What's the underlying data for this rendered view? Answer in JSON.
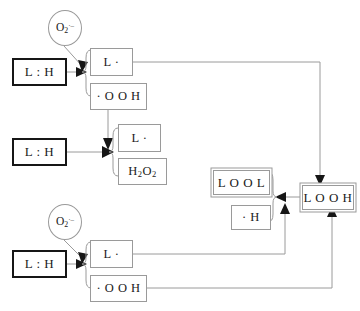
{
  "diagram": {
    "background_color": "#ffffff",
    "line_color": "#9a9a9a",
    "arrow_color": "#161616",
    "thick_border_color": "#161616",
    "nodes": {
      "oxygen_top": {
        "label": "O2",
        "subscript": "2",
        "superscript": "·–",
        "shape": "circle",
        "name": "superoxide-radical-top"
      },
      "oxygen_bottom": {
        "label": "O2",
        "subscript": "2",
        "superscript": "·–",
        "shape": "circle",
        "name": "superoxide-radical-bottom"
      },
      "lh_top": {
        "label": "L : H",
        "shape": "thick-box"
      },
      "lh_middle": {
        "label": "L : H",
        "shape": "thick-box"
      },
      "lh_bottom": {
        "label": "L : H",
        "shape": "thick-box"
      },
      "l_radical_top": {
        "label": "L ·",
        "shape": "thin-box"
      },
      "ooh_top": {
        "label": "· O O H",
        "shape": "thin-box"
      },
      "l_radical_middle": {
        "label": "L ·",
        "shape": "thin-box"
      },
      "h2o2": {
        "label": "H2O2",
        "subscripts": [
          "2",
          "2"
        ],
        "shape": "thin-box"
      },
      "l_radical_bottom": {
        "label": "L ·",
        "shape": "thin-box"
      },
      "ooh_bottom": {
        "label": "· O O H",
        "shape": "thin-box"
      },
      "lool": {
        "label": "L O O L",
        "shape": "double-box"
      },
      "h_radical": {
        "label": "· H",
        "shape": "thin-box"
      },
      "looh": {
        "label": "L O O H",
        "shape": "double-box"
      }
    },
    "braces": [
      {
        "name": "brace-top-products",
        "groups": [
          "l_radical_top",
          "ooh_top"
        ]
      },
      {
        "name": "brace-middle-products",
        "groups": [
          "l_radical_middle",
          "h2o2"
        ]
      },
      {
        "name": "brace-bottom-products",
        "groups": [
          "l_radical_bottom",
          "ooh_bottom"
        ]
      },
      {
        "name": "brace-lool-products",
        "groups": [
          "lool",
          "h_radical"
        ]
      }
    ],
    "edges": [
      {
        "from": "oxygen_top",
        "to": "lh_top",
        "arrow": true
      },
      {
        "from": "lh_top",
        "to": "brace-top-products",
        "arrow": true
      },
      {
        "from": "ooh_top",
        "to": "lh_middle_junction",
        "arrow": true
      },
      {
        "from": "lh_middle",
        "to": "brace-middle-products",
        "arrow": true
      },
      {
        "from": "l_radical_top",
        "to": "looh",
        "arrow": true
      },
      {
        "from": "oxygen_bottom",
        "to": "lh_bottom",
        "arrow": true
      },
      {
        "from": "lh_bottom",
        "to": "brace-bottom-products",
        "arrow": true
      },
      {
        "from": "l_radical_bottom",
        "to": "brace-lool-products",
        "arrow": true
      },
      {
        "from": "ooh_bottom",
        "to": "looh",
        "arrow": true
      },
      {
        "from": "looh",
        "to": "brace-lool-products",
        "arrow": true
      }
    ]
  }
}
